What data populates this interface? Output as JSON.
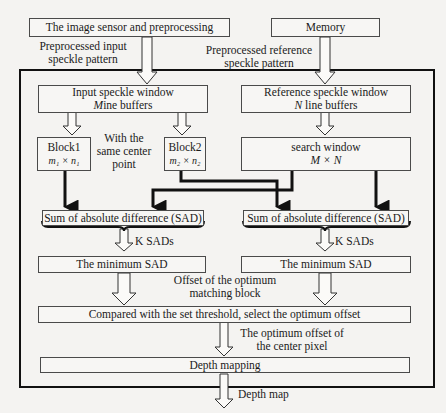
{
  "diagram": {
    "top": {
      "sensor_box": "The image sensor and preprocessing",
      "memory_box": "Memory",
      "input_label_1": "Preprocessed input",
      "input_label_2": "speckle pattern",
      "ref_label_1": "Preprocessed reference",
      "ref_label_2": "speckle pattern"
    },
    "left": {
      "input_window_1": "Input speckle window",
      "input_window_2_var": "M",
      "input_window_2_rest": "ine buffers",
      "block1_title": "Block1",
      "block1_dims": "m₁ × n₁",
      "block2_title": "Block2",
      "block2_dims": "m₂ × n₂",
      "center_note_1": "With the",
      "center_note_2": "same center",
      "center_note_3": "point",
      "sad_box": "Sum of absolute difference (SAD)",
      "k_sads": "K SADs",
      "min_sad": "The minimum SAD"
    },
    "right": {
      "ref_window_1": "Reference speckle window",
      "ref_window_2_var": "N",
      "ref_window_2_rest": " line buffers",
      "search_window_1": "search window",
      "search_window_2": "M × N",
      "sad_box": "Sum of absolute difference (SAD)",
      "k_sads": "K SADs",
      "min_sad": "The minimum SAD"
    },
    "bottom": {
      "offset_label_1": "Offset of the optimum",
      "offset_label_2": "matching block",
      "compare_box": "Compared with the set threshold, select the optimum offset",
      "center_offset_1": "The optimum offset of",
      "center_offset_2": "the  center pixel",
      "depth_mapping": "Depth mapping",
      "depth_map": "Depth map"
    }
  }
}
